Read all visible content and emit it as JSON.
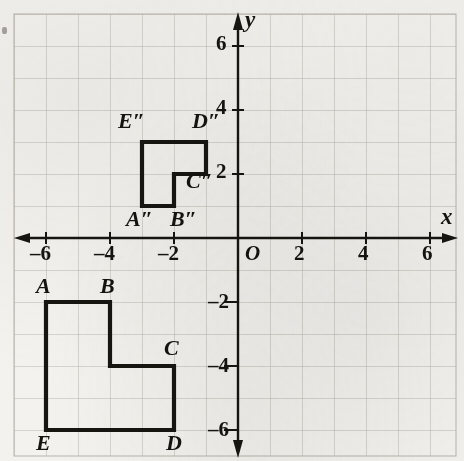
{
  "figure": {
    "type": "coordinate-plane-transformation",
    "axis_labels": {
      "x": "x",
      "y": "y",
      "origin": "O"
    },
    "x_ticks": [
      {
        "value": -6,
        "label": "–6"
      },
      {
        "value": -4,
        "label": "–4"
      },
      {
        "value": -2,
        "label": "–2"
      },
      {
        "value": 2,
        "label": "2"
      },
      {
        "value": 4,
        "label": "4"
      },
      {
        "value": 6,
        "label": "6"
      }
    ],
    "y_ticks": [
      {
        "value": 6,
        "label": "6"
      },
      {
        "value": 4,
        "label": "4"
      },
      {
        "value": 2,
        "label": "2"
      },
      {
        "value": -2,
        "label": "–2"
      },
      {
        "value": -4,
        "label": "–4"
      },
      {
        "value": -6,
        "label": "–6"
      }
    ],
    "grid": {
      "on": true,
      "spacing_units": 1,
      "x_range": [
        -7,
        7
      ],
      "y_range": [
        -7,
        7
      ]
    },
    "shapes": [
      {
        "name": "preimage",
        "vertex_labels": [
          "A",
          "B",
          "C",
          "D",
          "E"
        ],
        "vertices": [
          {
            "label": "A",
            "x": -6,
            "y": -2
          },
          {
            "label": "B",
            "x": -4,
            "y": -2
          },
          {
            "label": "C",
            "x": -2,
            "y": -4
          },
          {
            "label": "D",
            "x": -2,
            "y": -6
          },
          {
            "label": "E",
            "x": -6,
            "y": -6
          }
        ],
        "path": [
          [
            -6,
            -2
          ],
          [
            -4,
            -2
          ],
          [
            -4,
            -4
          ],
          [
            -2,
            -4
          ],
          [
            -2,
            -6
          ],
          [
            -6,
            -6
          ]
        ]
      },
      {
        "name": "image",
        "vertex_labels": [
          "A″",
          "B″",
          "C″",
          "D″",
          "E″"
        ],
        "vertices": [
          {
            "label": "A″",
            "x": -3,
            "y": 1
          },
          {
            "label": "B″",
            "x": -2,
            "y": 1
          },
          {
            "label": "C″",
            "x": -2,
            "y": 2
          },
          {
            "label": "D″",
            "x": -1,
            "y": 3
          },
          {
            "label": "E″",
            "x": -3,
            "y": 3
          }
        ],
        "path": [
          [
            -3,
            1
          ],
          [
            -2,
            1
          ],
          [
            -2,
            2
          ],
          [
            -1,
            2
          ],
          [
            -1,
            3
          ],
          [
            -3,
            3
          ]
        ]
      }
    ],
    "colors": {
      "paper": "#f3f2ef",
      "grid_line": "#b9b4ab",
      "axis": "#17150f",
      "shape_stroke": "#17150f",
      "text": "#15130f"
    }
  }
}
